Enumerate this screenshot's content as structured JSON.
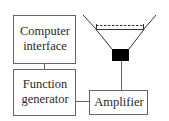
{
  "diagram": {
    "type": "block-diagram",
    "blocks": [
      {
        "id": "computer_interface",
        "lines": [
          "Computer",
          "interface"
        ]
      },
      {
        "id": "function_generator",
        "lines": [
          "Function",
          "generator"
        ]
      },
      {
        "id": "amplifier",
        "lines": [
          "Amplifier"
        ]
      }
    ],
    "components": [
      {
        "id": "speaker",
        "icon": "speaker-cone-icon"
      }
    ],
    "connections": [
      {
        "from": "computer_interface",
        "to": "function_generator"
      },
      {
        "from": "function_generator",
        "to": "amplifier"
      },
      {
        "from": "amplifier",
        "to": "speaker"
      }
    ],
    "colors": {
      "stroke": "#555555",
      "magnet": "#000000",
      "text": "#2a2a2a"
    }
  }
}
